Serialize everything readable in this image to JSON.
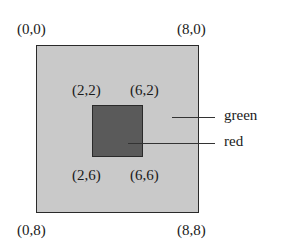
{
  "diagram": {
    "type": "nested-squares",
    "outer_region": {
      "name": "green",
      "fill": "#c9c9c9",
      "corners": {
        "top_left": "(0,0)",
        "top_right": "(8,0)",
        "bottom_left": "(0,8)",
        "bottom_right": "(8,8)"
      }
    },
    "inner_region": {
      "name": "red",
      "fill": "#5a5a5a",
      "corners": {
        "top_left": "(2,2)",
        "top_right": "(6,2)",
        "bottom_left": "(2,6)",
        "bottom_right": "(6,6)"
      }
    },
    "legend": [
      {
        "label": "green",
        "target": "outer_region"
      },
      {
        "label": "red",
        "target": "inner_region"
      }
    ]
  }
}
